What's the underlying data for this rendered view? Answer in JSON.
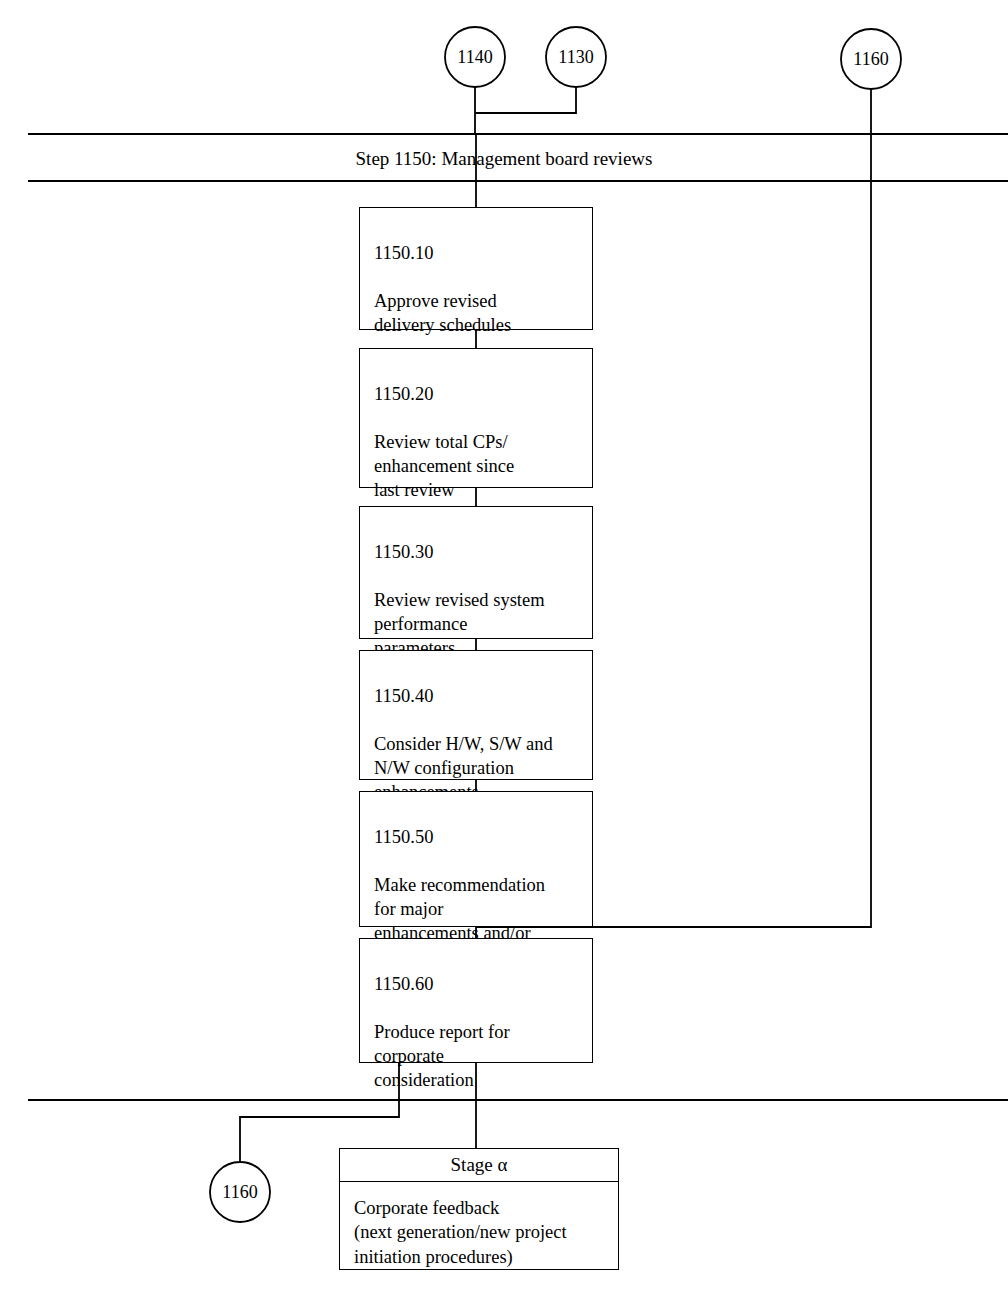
{
  "diagram": {
    "band": {
      "title": "Step 1150: Management board reviews"
    },
    "connectors": [
      {
        "id": "ref-1140",
        "label": "1140"
      },
      {
        "id": "ref-1130",
        "label": "1130"
      },
      {
        "id": "ref-1160-top",
        "label": "1160"
      },
      {
        "id": "ref-1160-bottom",
        "label": "1160"
      }
    ],
    "steps": [
      {
        "number": "1150.10",
        "text": "Approve revised\ndelivery schedules"
      },
      {
        "number": "1150.20",
        "text": "Review total CPs/\nenhancement since\nlast review"
      },
      {
        "number": "1150.30",
        "text": "Review revised system\nperformance\nparameters"
      },
      {
        "number": "1150.40",
        "text": "Consider H/W, S/W and\nN/W configuration\nenhancements"
      },
      {
        "number": "1150.50",
        "text": "Make recommendation\nfor major\nenhancements and/or\nnew projects"
      },
      {
        "number": "1150.60",
        "text": "Produce report for\ncorporate\nconsideration"
      }
    ],
    "stage": {
      "header": "Stage α",
      "text": "Corporate  feedback\n(next generation/new  project\ninitiation procedures)"
    },
    "colors": {
      "stroke": "#000000",
      "background": "#ffffff"
    }
  }
}
